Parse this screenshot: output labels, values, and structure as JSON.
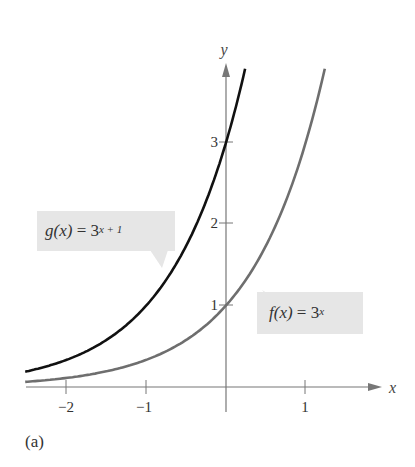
{
  "chart_data": {
    "type": "line",
    "title": "",
    "xlabel": "x",
    "ylabel": "y",
    "xlim": [
      -2.5,
      1.5
    ],
    "ylim": [
      0,
      3.8
    ],
    "grid": false,
    "x_ticks": [
      -2,
      -1,
      1
    ],
    "x_tick_labels": [
      "−2",
      "−1",
      "1"
    ],
    "y_ticks": [
      1,
      2,
      3
    ],
    "y_tick_labels": [
      "1",
      "2",
      "3"
    ],
    "series": [
      {
        "name": "g(x) = 3^(x+1)",
        "function": "3^(x+1)",
        "color": "#111111",
        "x": [
          -2.5,
          -2,
          -1.5,
          -1,
          -0.5,
          0,
          0.2
        ],
        "values": [
          0.19,
          0.33,
          0.58,
          1.0,
          1.73,
          3.0,
          3.74
        ]
      },
      {
        "name": "f(x) = 3^x",
        "function": "3^x",
        "color": "#6e6e6e",
        "x": [
          -2.5,
          -2,
          -1,
          0,
          0.5,
          1,
          1.2
        ],
        "values": [
          0.06,
          0.11,
          0.33,
          1.0,
          1.73,
          3.0,
          3.74
        ]
      }
    ],
    "annotations": [
      "g(x) = 3^(x + 1)",
      "f(x) = 3^x"
    ],
    "caption": "(a)"
  },
  "labels": {
    "g": {
      "name": "g",
      "arg": "(x)",
      "eq": "=",
      "base": "3",
      "exp": "x + 1"
    },
    "f": {
      "name": "f",
      "arg": "(x)",
      "eq": "=",
      "base": "3",
      "exp": "x"
    }
  },
  "axes": {
    "x_label": "x",
    "y_label": "y",
    "x_ticks": [
      "−2",
      "−1",
      "1"
    ],
    "y_ticks": [
      "1",
      "2",
      "3"
    ]
  },
  "caption": "(a)"
}
